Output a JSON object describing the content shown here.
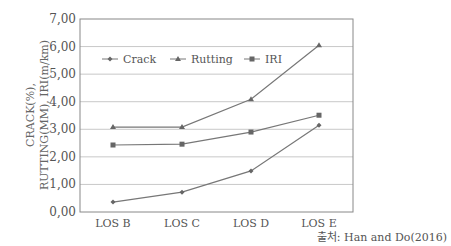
{
  "chart_data": {
    "type": "line",
    "title": "",
    "xlabel": "",
    "ylabel": [
      "CRACK(%),",
      "RUTTING(MM), IRI(m/km)"
    ],
    "categories": [
      "LOS B",
      "LOS C",
      "LOS D",
      "LOS E"
    ],
    "ylim": [
      0,
      7
    ],
    "yticks": [
      "0,00",
      "1,00",
      "2,00",
      "3,00",
      "4,00",
      "5,00",
      "6,00",
      "7,00"
    ],
    "grid": true,
    "legend_position": "top-left inside",
    "series": [
      {
        "name": "Crack",
        "marker": "diamond",
        "values": [
          0.36,
          0.72,
          1.49,
          3.15
        ]
      },
      {
        "name": "Rutting",
        "marker": "triangle",
        "values": [
          3.08,
          3.08,
          4.09,
          6.05
        ]
      },
      {
        "name": "IRI",
        "marker": "square",
        "values": [
          2.43,
          2.46,
          2.9,
          3.51
        ]
      }
    ]
  },
  "source": "출처: Han and Do(2016)",
  "colors": {
    "line": "#777777",
    "grid": "#c8c8c8",
    "axis": "#888888"
  }
}
